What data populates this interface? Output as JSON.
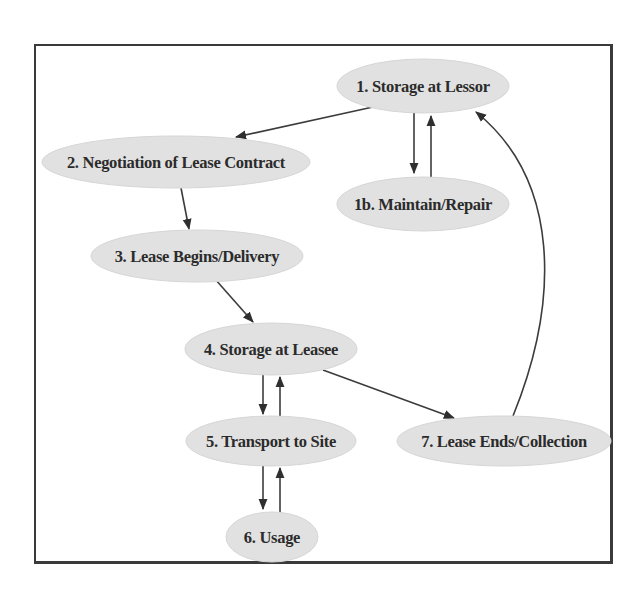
{
  "diagram": {
    "type": "directed-graph",
    "title": "",
    "nodes": [
      {
        "id": "n1",
        "label": "1. Storage at Lessor",
        "cx": 423,
        "cy": 86,
        "rx": 86,
        "ry": 27
      },
      {
        "id": "n1b",
        "label": "1b. Maintain/Repair",
        "cx": 423,
        "cy": 204,
        "rx": 86,
        "ry": 27
      },
      {
        "id": "n2",
        "label": "2. Negotiation of Lease Contract",
        "cx": 176,
        "cy": 162,
        "rx": 134,
        "ry": 26
      },
      {
        "id": "n3",
        "label": "3. Lease Begins/Delivery",
        "cx": 197,
        "cy": 256,
        "rx": 106,
        "ry": 26
      },
      {
        "id": "n4",
        "label": "4. Storage at Leasee",
        "cx": 271,
        "cy": 349,
        "rx": 86,
        "ry": 26
      },
      {
        "id": "n5",
        "label": "5. Transport to Site",
        "cx": 271,
        "cy": 441,
        "rx": 85,
        "ry": 25
      },
      {
        "id": "n6",
        "label": "6. Usage",
        "cx": 272,
        "cy": 537,
        "rx": 46,
        "ry": 25
      },
      {
        "id": "n7",
        "label": "7. Lease Ends/Collection",
        "cx": 504,
        "cy": 441,
        "rx": 107,
        "ry": 25
      }
    ],
    "edges": [
      {
        "from": "n1",
        "to": "n2"
      },
      {
        "from": "n1",
        "to": "n1b"
      },
      {
        "from": "n1b",
        "to": "n1"
      },
      {
        "from": "n2",
        "to": "n3"
      },
      {
        "from": "n3",
        "to": "n4"
      },
      {
        "from": "n4",
        "to": "n5"
      },
      {
        "from": "n5",
        "to": "n4"
      },
      {
        "from": "n5",
        "to": "n6"
      },
      {
        "from": "n6",
        "to": "n5"
      },
      {
        "from": "n4",
        "to": "n7"
      },
      {
        "from": "n7",
        "to": "n1"
      }
    ],
    "colors": {
      "node_fill": "#e1e1e1",
      "edge": "#3c3c3c",
      "text": "#2b2b2b",
      "frame": "#3a3a3a"
    }
  }
}
